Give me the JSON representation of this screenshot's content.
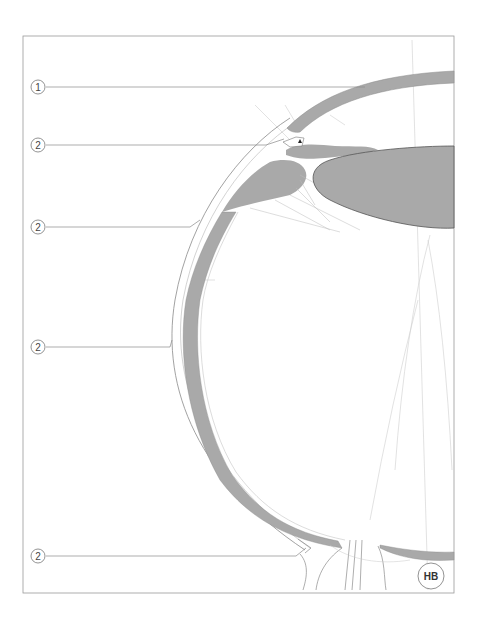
{
  "diagram": {
    "colors": {
      "tissue_fill": "#a9a9a9",
      "line": "#888888",
      "frame": "#9a9a9a",
      "background": "#ffffff"
    },
    "callouts": [
      {
        "id": "c1",
        "label": "1",
        "target": "cornea",
        "y": 87
      },
      {
        "id": "c2",
        "label": "2",
        "target": "limbus",
        "y": 145
      },
      {
        "id": "c3",
        "label": "2",
        "target": "sclera-upper",
        "y": 227
      },
      {
        "id": "c4",
        "label": "2",
        "target": "sclera-middle",
        "y": 347
      },
      {
        "id": "c5",
        "label": "2",
        "target": "sclera-posterior",
        "y": 556
      }
    ],
    "badge": {
      "label": "HB"
    }
  }
}
